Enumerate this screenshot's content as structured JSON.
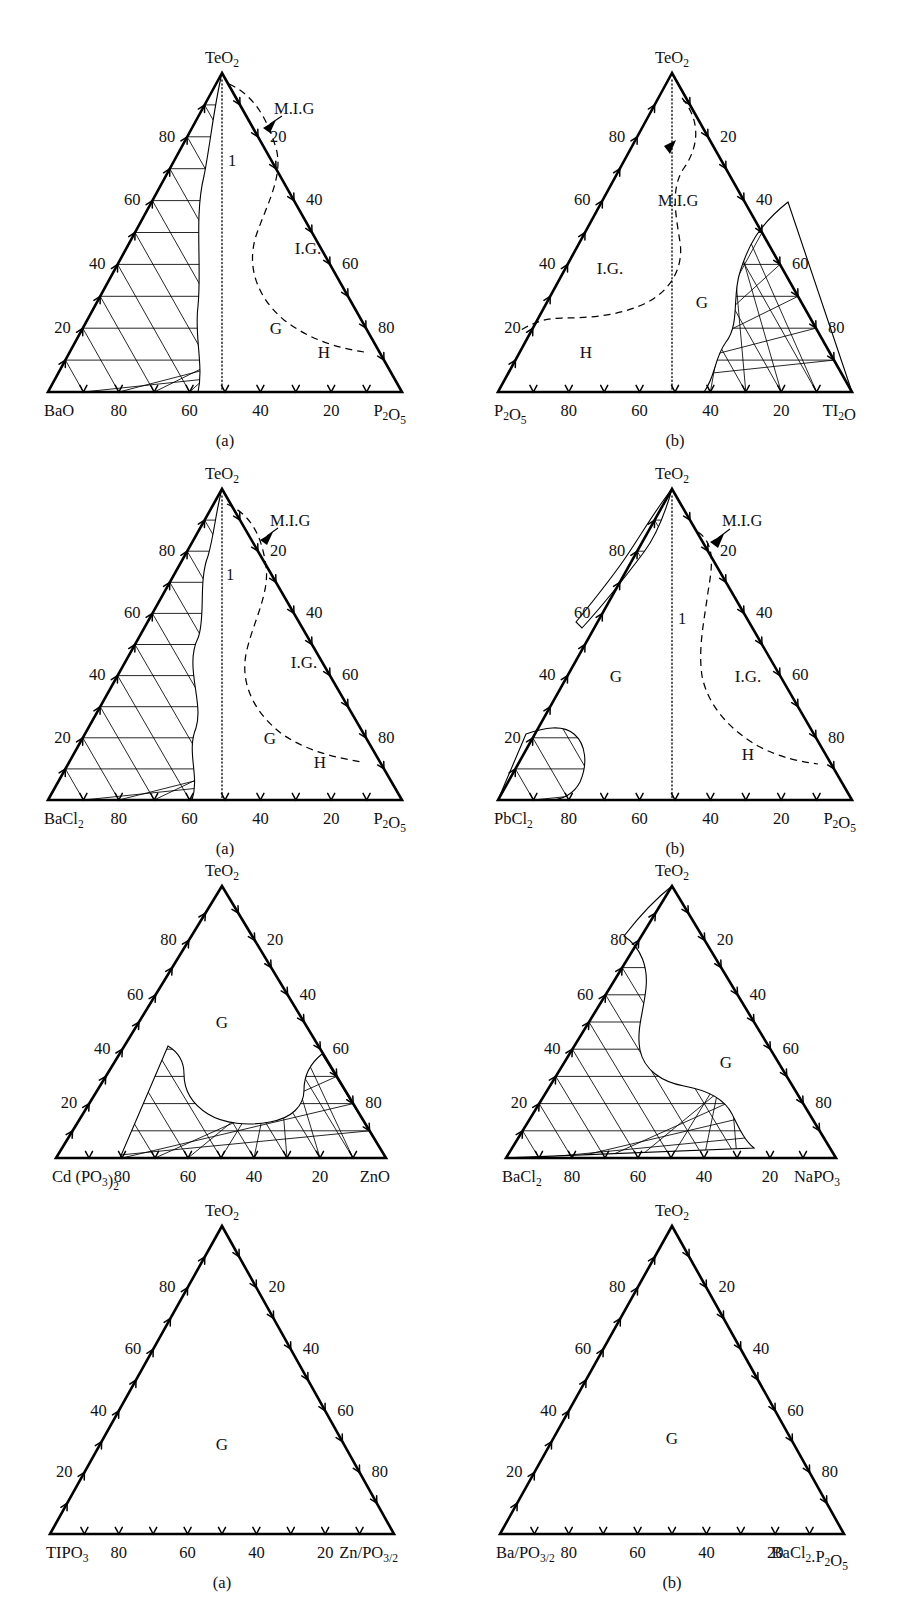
{
  "figure": {
    "title_hidden_partial": "",
    "panels": [
      {
        "id": "panel-1a",
        "caption": "(a)",
        "apex_label": "TeO",
        "apex_sub": "2",
        "left_corner": "BaO",
        "left_corner_sub": "",
        "right_corner": "P",
        "right_corner_sub": "2",
        "right_corner_tail": "O",
        "right_corner_sub2": "5",
        "right_corner_full": "P2O5",
        "left_axis_ticks": [
          "80",
          "60",
          "40",
          "20"
        ],
        "right_axis_ticks": [
          "20",
          "40",
          "60",
          "80"
        ],
        "bottom_axis_ticks": [
          "80",
          "60",
          "40",
          "20"
        ],
        "regions": [
          {
            "label": "M.I.G",
            "kind": "pointer"
          },
          {
            "label": "I.G.",
            "kind": "text"
          },
          {
            "label": "G",
            "kind": "text"
          },
          {
            "label": "H",
            "kind": "text"
          },
          {
            "label": "1",
            "kind": "text"
          }
        ],
        "has_hatched_region": true,
        "hatched_side": "left",
        "has_dashed_boundary": true,
        "has_dotted_centerline": true
      },
      {
        "id": "panel-1b",
        "caption": "(b)",
        "apex_label": "TeO",
        "apex_sub": "2",
        "left_corner": "P",
        "left_corner_sub": "2",
        "left_corner_tail": "O",
        "left_corner_sub2": "5",
        "left_corner_full": "P2O5",
        "right_corner": "TI",
        "right_corner_sub": "2",
        "right_corner_tail": "O",
        "right_corner_full": "TI2O",
        "left_axis_ticks": [
          "80",
          "60",
          "40",
          "20"
        ],
        "right_axis_ticks": [
          "20",
          "40",
          "60",
          "80"
        ],
        "bottom_axis_ticks": [
          "80",
          "60",
          "40",
          "20"
        ],
        "regions": [
          {
            "label": "M.I.G",
            "kind": "text"
          },
          {
            "label": "I.G.",
            "kind": "text"
          },
          {
            "label": "G",
            "kind": "text"
          },
          {
            "label": "H",
            "kind": "text"
          }
        ],
        "has_hatched_region": true,
        "hatched_side": "right",
        "has_dashed_boundary": true,
        "has_dotted_centerline": true
      },
      {
        "id": "panel-2a",
        "caption": "(a)",
        "apex_label": "TeO",
        "apex_sub": "2",
        "left_corner": "BaCl",
        "left_corner_sub": "2",
        "left_corner_full": "BaCl2",
        "right_corner": "P",
        "right_corner_sub": "2",
        "right_corner_tail": "O",
        "right_corner_sub2": "5",
        "right_corner_full": "P2O5",
        "left_axis_ticks": [
          "80",
          "60",
          "40",
          "20"
        ],
        "right_axis_ticks": [
          "20",
          "40",
          "60",
          "80"
        ],
        "bottom_axis_ticks": [
          "80",
          "60",
          "40",
          "20"
        ],
        "regions": [
          {
            "label": "M.I.G",
            "kind": "pointer"
          },
          {
            "label": "I.G.",
            "kind": "text"
          },
          {
            "label": "G",
            "kind": "text"
          },
          {
            "label": "H",
            "kind": "text"
          },
          {
            "label": "1",
            "kind": "text"
          }
        ],
        "has_hatched_region": true,
        "hatched_side": "left",
        "has_dashed_boundary": true,
        "has_dotted_centerline": true
      },
      {
        "id": "panel-2b",
        "caption": "(b)",
        "apex_label": "TeO",
        "apex_sub": "2",
        "left_corner": "PbCl",
        "left_corner_sub": "2",
        "left_corner_full": "PbCl2",
        "right_corner": "P",
        "right_corner_sub": "2",
        "right_corner_tail": "O",
        "right_corner_sub2": "5",
        "right_corner_full": "P2O5",
        "left_axis_ticks": [
          "80",
          "60",
          "40",
          "20"
        ],
        "right_axis_ticks": [
          "20",
          "40",
          "60",
          "80"
        ],
        "bottom_axis_ticks": [
          "80",
          "60",
          "40",
          "20"
        ],
        "regions": [
          {
            "label": "M.I.G",
            "kind": "pointer"
          },
          {
            "label": "I.G.",
            "kind": "text"
          },
          {
            "label": "G",
            "kind": "text"
          },
          {
            "label": "H",
            "kind": "text"
          },
          {
            "label": "1",
            "kind": "text"
          }
        ],
        "has_hatched_region": true,
        "hatched_side": "left-corner-and-top",
        "has_dashed_boundary": true,
        "has_dotted_centerline": true
      },
      {
        "id": "panel-3a",
        "caption": "",
        "apex_label": "TeO",
        "apex_sub": "2",
        "left_corner": "Cd (PO",
        "left_corner_sub": "3",
        "left_corner_tail": ")",
        "left_corner_sub2": "2",
        "left_corner_full": "Cd (PO3)2",
        "right_corner": "ZnO",
        "right_corner_full": "ZnO",
        "left_axis_ticks": [
          "80",
          "60",
          "40",
          "20"
        ],
        "right_axis_ticks": [
          "20",
          "40",
          "60",
          "80"
        ],
        "bottom_axis_ticks": [
          "80",
          "60",
          "40",
          "20"
        ],
        "regions": [
          {
            "label": "G",
            "kind": "text"
          }
        ],
        "has_hatched_region": true,
        "hatched_side": "bottom-band",
        "has_dashed_boundary": false,
        "has_dotted_centerline": false
      },
      {
        "id": "panel-3b",
        "caption": "",
        "apex_label": "TeO",
        "apex_sub": "2",
        "left_corner": "BaCl",
        "left_corner_sub": "2",
        "left_corner_full": "BaCl2",
        "right_corner": "NaPO",
        "right_corner_sub": "3",
        "right_corner_full": "NaPO3",
        "left_axis_ticks": [
          "80",
          "60",
          "40",
          "20"
        ],
        "right_axis_ticks": [
          "20",
          "40",
          "60",
          "80"
        ],
        "bottom_axis_ticks": [
          "80",
          "60",
          "40",
          "20"
        ],
        "regions": [
          {
            "label": "G",
            "kind": "text"
          }
        ],
        "has_hatched_region": true,
        "hatched_side": "left-lower",
        "has_dashed_boundary": false,
        "has_dotted_centerline": false
      },
      {
        "id": "panel-4a",
        "caption": "(a)",
        "apex_label": "TeO",
        "apex_sub": "2",
        "left_corner": "TIPO",
        "left_corner_sub": "3",
        "left_corner_full": "TIPO3",
        "right_corner": "Zn/PO",
        "right_corner_sub": "3/2",
        "right_corner_full": "Zn/PO3/2",
        "left_axis_ticks": [
          "80",
          "60",
          "40",
          "20"
        ],
        "right_axis_ticks": [
          "20",
          "40",
          "60",
          "80"
        ],
        "bottom_axis_ticks": [
          "80",
          "60",
          "40",
          "20"
        ],
        "regions": [
          {
            "label": "G",
            "kind": "text"
          }
        ],
        "has_hatched_region": false,
        "has_dashed_boundary": false,
        "has_dotted_centerline": false
      },
      {
        "id": "panel-4b",
        "caption": "(b)",
        "apex_label": "TeO",
        "apex_sub": "2",
        "left_corner": "Ba/PO",
        "left_corner_sub": "3/2",
        "left_corner_full": "Ba/PO3/2",
        "right_corner": "BaCl",
        "right_corner_sub": "2",
        "right_corner_tail": ".P",
        "right_corner_sub2": "2",
        "right_corner_tail2": "O",
        "right_corner_sub3": "5",
        "right_corner_full": "BaCl2.P2O5",
        "left_axis_ticks": [
          "80",
          "60",
          "40",
          "20"
        ],
        "right_axis_ticks": [
          "20",
          "40",
          "60",
          "80"
        ],
        "bottom_axis_ticks": [
          "80",
          "60",
          "40",
          "20"
        ],
        "regions": [
          {
            "label": "G",
            "kind": "text"
          }
        ],
        "has_hatched_region": false,
        "has_dashed_boundary": false,
        "has_dotted_centerline": false
      }
    ]
  },
  "chart_data": {
    "type": "ternary-phase-diagram-grid",
    "count": 8,
    "grid": {
      "rows": 4,
      "cols": 2
    },
    "axis_scale": [
      20,
      40,
      60,
      80
    ],
    "axis_units": "mol %",
    "region_key": {
      "G": "Glass forming region",
      "I.G.": "Intermediate glass region",
      "M.I.G": "Marginal / metastable intermediate glass",
      "H": "Homogeneous region",
      "1": "boundary curve 1"
    },
    "systems": [
      {
        "panel": "(a)",
        "row": 1,
        "apex": "TeO2",
        "left": "BaO",
        "right": "P2O5",
        "regions": [
          "M.I.G",
          "I.G.",
          "G",
          "H"
        ],
        "hatched": "BaO-rich side up to ~55 % BaO"
      },
      {
        "panel": "(b)",
        "row": 1,
        "apex": "TeO2",
        "left": "P2O5",
        "right": "TI2O",
        "regions": [
          "M.I.G",
          "I.G.",
          "G",
          "H"
        ],
        "hatched": "TI2O-rich corner beyond ~35 % TI2O"
      },
      {
        "panel": "(a)",
        "row": 2,
        "apex": "TeO2",
        "left": "BaCl2",
        "right": "P2O5",
        "regions": [
          "M.I.G",
          "I.G.",
          "G",
          "H"
        ],
        "hatched": "BaCl2-rich side up to ~55 % BaCl2"
      },
      {
        "panel": "(b)",
        "row": 2,
        "apex": "TeO2",
        "left": "PbCl2",
        "right": "P2O5",
        "regions": [
          "M.I.G",
          "I.G.",
          "G",
          "H"
        ],
        "hatched": "narrow band near TeO2-PbCl2 edge plus PbCl2 corner"
      },
      {
        "panel": "",
        "row": 3,
        "apex": "TeO2",
        "left": "Cd (PO3)2",
        "right": "ZnO",
        "regions": [
          "G"
        ],
        "hatched": "full bottom band below the glass lobe"
      },
      {
        "panel": "",
        "row": 3,
        "apex": "TeO2",
        "left": "BaCl2",
        "right": "NaPO3",
        "regions": [
          "G"
        ],
        "hatched": "BaCl2-rich left and lower region"
      },
      {
        "panel": "(a)",
        "row": 4,
        "apex": "TeO2",
        "left": "TIPO3",
        "right": "Zn/PO3/2",
        "regions": [
          "G"
        ],
        "hatched": "none — whole field is glass forming"
      },
      {
        "panel": "(b)",
        "row": 4,
        "apex": "TeO2",
        "left": "Ba/PO3/2",
        "right": "BaCl2.P2O5",
        "regions": [
          "G"
        ],
        "hatched": "none — whole field is glass forming"
      }
    ]
  }
}
